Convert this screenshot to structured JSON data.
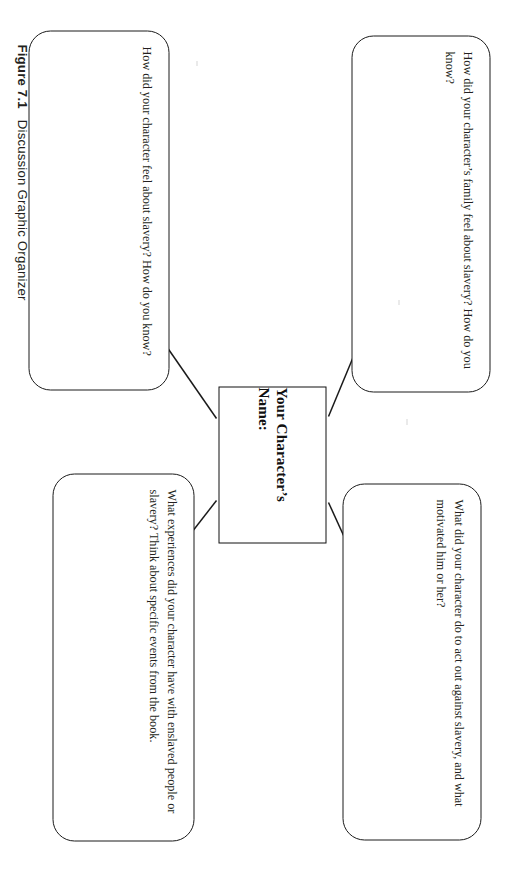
{
  "figure": {
    "caption_label": "Figure 7.1",
    "caption_title": "Discussion Graphic Organizer",
    "orientation": "rotated-90-clockwise",
    "ink_color": "#231f20",
    "background_color": "#ffffff"
  },
  "organizer": {
    "center": {
      "label": "Your Character’s Name:"
    },
    "branches": [
      {
        "id": "family",
        "position": "top-left",
        "text": "How did your character’s family feel about slavery? How do you know?"
      },
      {
        "id": "actions",
        "position": "top-right",
        "text": "What did your character do to act out against slavery, and what motivated him or her?"
      },
      {
        "id": "feelings",
        "position": "bottom-left",
        "text": "How did your character feel about slavery? How do you know?"
      },
      {
        "id": "experiences",
        "position": "bottom-right",
        "text": "What experiences did your character have with enslaved people or slavery? Think about specific events from the book."
      }
    ],
    "connectors": [
      {
        "id": "to-family",
        "from": "center",
        "to": "family",
        "style": "single-arrow"
      },
      {
        "id": "to-actions",
        "from": "center",
        "to": "actions",
        "style": "single-arrow"
      },
      {
        "id": "to-feelings",
        "from": "center",
        "to": "feelings",
        "style": "single-arrow"
      },
      {
        "id": "to-experiences",
        "from": "center",
        "to": "experiences",
        "style": "single-arrow"
      }
    ]
  }
}
